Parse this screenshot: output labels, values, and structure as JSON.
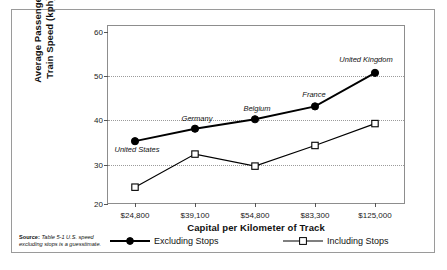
{
  "chart_data": {
    "type": "line",
    "title": "",
    "xlabel": "Capital per Kilometer of Track",
    "ylabel": "Average Passenger\nTrain Speed (kph)",
    "ylabel_line1": "Average Passenger",
    "ylabel_line2": "Train Speed (kph)",
    "categories": [
      "$24,800",
      "$39,100",
      "$54,800",
      "$83,300",
      "$125,000"
    ],
    "point_labels": [
      "United States",
      "Germany",
      "Belgium",
      "France",
      "United Kingdom"
    ],
    "ylim": [
      20,
      60
    ],
    "yticks": [
      20,
      30,
      40,
      50,
      60
    ],
    "ytick_labels": [
      "20",
      "30",
      "40",
      "50",
      "60"
    ],
    "grid": "horizontal-dotted",
    "legend_position": "below-plot",
    "series": [
      {
        "name": "Excluding Stops",
        "marker": "filled-circle",
        "values": [
          34.5,
          37.4,
          39.6,
          42.6,
          50.4
        ]
      },
      {
        "name": "Including Stops",
        "marker": "open-square",
        "values": [
          23.8,
          31.5,
          28.7,
          33.5,
          38.6
        ]
      }
    ],
    "colors": {
      "line": "#000000",
      "grid": "#9b9b9b",
      "frame": "#8d8d8d",
      "background": "#ffffff",
      "text": "#111111"
    }
  },
  "source": {
    "label": "Source:",
    "text": "Table 5-1 U.S. speed excluding stops is a guesstimate."
  }
}
